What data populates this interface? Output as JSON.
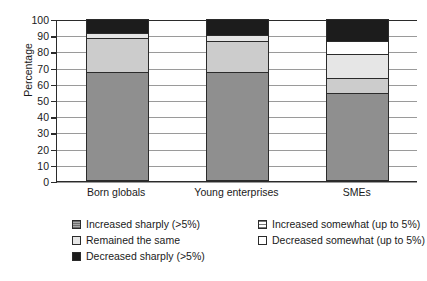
{
  "chart_data": {
    "type": "bar",
    "subtype": "stacked-bar",
    "title": "",
    "xlabel": "",
    "ylabel": "Percentage",
    "ylim": [
      0,
      100
    ],
    "ytick_step": 10,
    "yticks": [
      0,
      10,
      20,
      30,
      40,
      50,
      60,
      70,
      80,
      90,
      100
    ],
    "ytick_labels": [
      "0",
      "10",
      "20",
      "30",
      "40",
      "50",
      "60",
      "70",
      "80",
      "90",
      "100"
    ],
    "grid": true,
    "grid_axis": "y",
    "legend_position": "below",
    "stack_order": "bottom-to-top",
    "categories": [
      "Born globals",
      "Young enterprises",
      "SMEs"
    ],
    "series": [
      {
        "name": "Increased sharply (>5%)",
        "color": "#8f8f8f",
        "values": [
          67,
          67,
          54
        ]
      },
      {
        "name": "Increased somewhat (up to 5%)",
        "color": "#cccccc",
        "values": [
          21,
          19,
          9
        ]
      },
      {
        "name": "Remained the same",
        "color": "#e6e6e6",
        "values": [
          3.5,
          4,
          15
        ]
      },
      {
        "name": "Decreased somewhat (up to 5%)",
        "color": "#ffffff",
        "values": [
          0,
          0,
          8
        ]
      },
      {
        "name": "Decreased sharply (>5%)",
        "color": "#1c1c1c",
        "values": [
          8.5,
          10,
          14
        ]
      }
    ]
  },
  "axis": {
    "y_title": "Percentage",
    "ticks": [
      {
        "label": "100",
        "value": 100
      },
      {
        "label": "90",
        "value": 90
      },
      {
        "label": "80",
        "value": 80
      },
      {
        "label": "70",
        "value": 70
      },
      {
        "label": "60",
        "value": 60
      },
      {
        "label": "50",
        "value": 50
      },
      {
        "label": "40",
        "value": 40
      },
      {
        "label": "30",
        "value": 30
      },
      {
        "label": "20",
        "value": 20
      },
      {
        "label": "10",
        "value": 10
      },
      {
        "label": "0",
        "value": 0
      }
    ],
    "categories": [
      "Born globals",
      "Young enterprises",
      "SMEs"
    ]
  },
  "legend": {
    "entries": [
      {
        "label": "Increased sharply (>5%)",
        "swatch": "dark"
      },
      {
        "label": "Increased somewhat (up to 5%)",
        "swatch": "mid"
      },
      {
        "label": "Remained the same",
        "swatch": "light"
      },
      {
        "label": "Decreased somewhat (up to 5%)",
        "swatch": "white"
      },
      {
        "label": "Decreased sharply (>5%)",
        "swatch": "black"
      }
    ]
  }
}
